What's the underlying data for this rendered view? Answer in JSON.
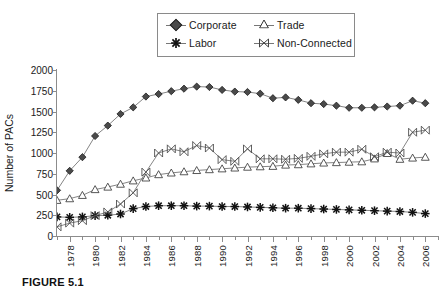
{
  "figure": {
    "caption": "FIGURE 5.1",
    "ylabel": "Number of PACs"
  },
  "legend": {
    "position": "top-center",
    "entries": [
      {
        "label": "Corporate",
        "marker": "filled-diamond"
      },
      {
        "label": "Trade",
        "marker": "open-triangle"
      },
      {
        "label": "Labor",
        "marker": "filled-star"
      },
      {
        "label": "Non-Connected",
        "marker": "x-in-box"
      }
    ]
  },
  "chart_data": {
    "type": "line",
    "title": "",
    "xlabel": "",
    "ylabel": "Number of PACs",
    "ylim": [
      0,
      2000
    ],
    "yticks": [
      0,
      250,
      500,
      750,
      1000,
      1250,
      1500,
      1750,
      2000
    ],
    "xlim": [
      1977,
      2007
    ],
    "x": [
      1977,
      1978,
      1979,
      1980,
      1981,
      1982,
      1983,
      1984,
      1985,
      1986,
      1987,
      1988,
      1989,
      1990,
      1991,
      1992,
      1993,
      1994,
      1995,
      1996,
      1997,
      1998,
      1999,
      2000,
      2001,
      2002,
      2003,
      2004,
      2005,
      2006
    ],
    "xtick_labels": [
      "1978",
      "1980",
      "1982",
      "1984",
      "1986",
      "1988",
      "1990",
      "1992",
      "1994",
      "1996",
      "1998",
      "2000",
      "2002",
      "2004",
      "2006"
    ],
    "grid": false,
    "legend_position": "top-center",
    "series": [
      {
        "name": "Corporate",
        "marker": "filled-diamond",
        "color": "#4a4a4a",
        "values": [
          550,
          785,
          950,
          1205,
          1330,
          1470,
          1550,
          1680,
          1710,
          1745,
          1775,
          1800,
          1795,
          1760,
          1740,
          1735,
          1715,
          1660,
          1670,
          1640,
          1600,
          1590,
          1570,
          1545,
          1545,
          1550,
          1560,
          1570,
          1630,
          1600
        ]
      },
      {
        "name": "Trade",
        "marker": "open-triangle",
        "color": "#ffffff",
        "values": [
          430,
          450,
          490,
          560,
          590,
          625,
          665,
          700,
          740,
          760,
          775,
          790,
          800,
          810,
          820,
          830,
          835,
          840,
          855,
          860,
          870,
          880,
          885,
          890,
          895,
          930,
          995,
          925,
          940,
          950
        ]
      },
      {
        "name": "Labor",
        "marker": "filled-star",
        "color": "#111111",
        "values": [
          230,
          225,
          230,
          245,
          250,
          265,
          330,
          355,
          365,
          365,
          365,
          360,
          360,
          355,
          355,
          350,
          345,
          340,
          335,
          335,
          330,
          325,
          320,
          315,
          310,
          305,
          300,
          295,
          285,
          270
        ]
      },
      {
        "name": "Non-Connected",
        "marker": "x-in-box",
        "color": "#555555",
        "values": [
          110,
          155,
          185,
          245,
          290,
          385,
          520,
          770,
          1000,
          1050,
          1015,
          1090,
          1060,
          920,
          900,
          1050,
          930,
          930,
          925,
          935,
          960,
          990,
          1010,
          1010,
          1045,
          955,
          1010,
          1000,
          1250,
          1275
        ]
      }
    ]
  }
}
